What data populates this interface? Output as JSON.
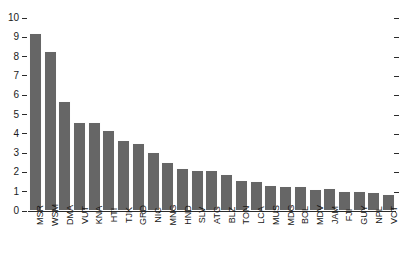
{
  "chart_data": {
    "type": "bar",
    "title": "",
    "subtitle": "",
    "xlabel": "",
    "ylabel": "",
    "ylim": [
      0,
      10
    ],
    "grid": false,
    "legend": null,
    "legend_position": "none",
    "y_ticks": [
      0,
      1,
      2,
      3,
      4,
      5,
      6,
      7,
      8,
      9,
      10
    ],
    "y_tick_labels": [
      "0",
      "1",
      "2",
      "3",
      "4",
      "5",
      "6",
      "7",
      "8",
      "9",
      "10"
    ],
    "right_axis_ticks_unlabeled": true,
    "bar_color": "#666666",
    "categories": [
      "MSR",
      "WSM",
      "DMA",
      "VUT",
      "KNA",
      "HTI",
      "TJK",
      "GRD",
      "NIC",
      "MNG",
      "HND",
      "SLV",
      "ATG",
      "BLZ",
      "TON",
      "LCA",
      "MUS",
      "MDG",
      "BOL",
      "MDV",
      "JAM",
      "FJI",
      "GUY",
      "NPL",
      "VCT"
    ],
    "values": [
      9.2,
      8.3,
      5.7,
      4.6,
      4.6,
      4.2,
      3.7,
      3.5,
      3.05,
      2.55,
      2.25,
      2.15,
      2.1,
      1.9,
      1.6,
      1.55,
      1.35,
      1.3,
      1.3,
      1.15,
      1.2,
      1.05,
      1.05,
      1.0,
      0.9
    ]
  }
}
